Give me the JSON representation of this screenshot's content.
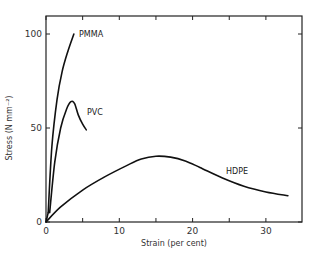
{
  "chart_data": {
    "type": "line",
    "title": "",
    "xlabel": "Strain (per cent)",
    "ylabel": "Stress (N mm⁻²)",
    "xlim": [
      0,
      35
    ],
    "ylim": [
      0,
      110
    ],
    "x_ticks": [
      0,
      10,
      20,
      30
    ],
    "x_minor_ticks": [
      5,
      15,
      25
    ],
    "y_ticks": [
      0,
      50,
      100
    ],
    "grid": false,
    "legend": "inline labels at curve ends",
    "series": [
      {
        "name": "PMMA",
        "x": [
          0.3,
          0.8,
          1.5,
          2.2,
          3.0,
          3.8
        ],
        "y": [
          5,
          40,
          65,
          80,
          91,
          100
        ]
      },
      {
        "name": "PVC",
        "x": [
          0.5,
          1.2,
          2.0,
          2.8,
          3.4,
          3.9,
          4.4,
          5.0,
          5.5
        ],
        "y": [
          5,
          32,
          50,
          60,
          64,
          63,
          57,
          52,
          49
        ]
      },
      {
        "name": "HDPE",
        "x": [
          0,
          2,
          5,
          8,
          11,
          13,
          15,
          17,
          19,
          21,
          24,
          27,
          30,
          33
        ],
        "y": [
          0,
          8,
          17,
          24,
          30,
          33.5,
          35,
          34.5,
          32.5,
          29,
          23.5,
          19,
          16,
          14
        ]
      }
    ]
  }
}
